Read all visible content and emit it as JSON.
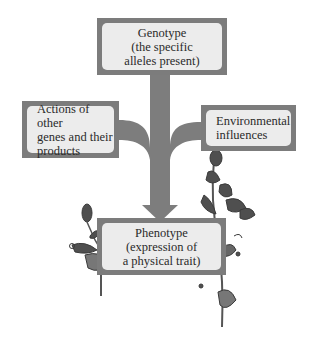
{
  "diagram": {
    "colors": {
      "frame": "#7c7c7c",
      "box_fill": "#ececec",
      "arrow": "#7d7d7d",
      "text": "#2a2a2a",
      "plant": "#4a4a4a"
    },
    "nodes": {
      "genotype": {
        "lines": [
          "Genotype",
          "(the specific",
          "alleles present)"
        ]
      },
      "actions": {
        "lines": [
          "Actions of other",
          "genes and their",
          "products"
        ]
      },
      "environment": {
        "lines": [
          "Environmental",
          "influences"
        ]
      },
      "phenotype": {
        "lines": [
          "Phenotype",
          "(expression of",
          "a physical trait)"
        ]
      }
    },
    "edges": [
      {
        "from": "genotype",
        "to": "phenotype",
        "type": "arrow"
      },
      {
        "from": "actions",
        "to": "phenotype",
        "type": "merge-branch"
      },
      {
        "from": "environment",
        "to": "phenotype",
        "type": "merge-branch"
      }
    ],
    "illustrations": [
      "flowering-plant-left",
      "flowering-plant-right"
    ]
  }
}
